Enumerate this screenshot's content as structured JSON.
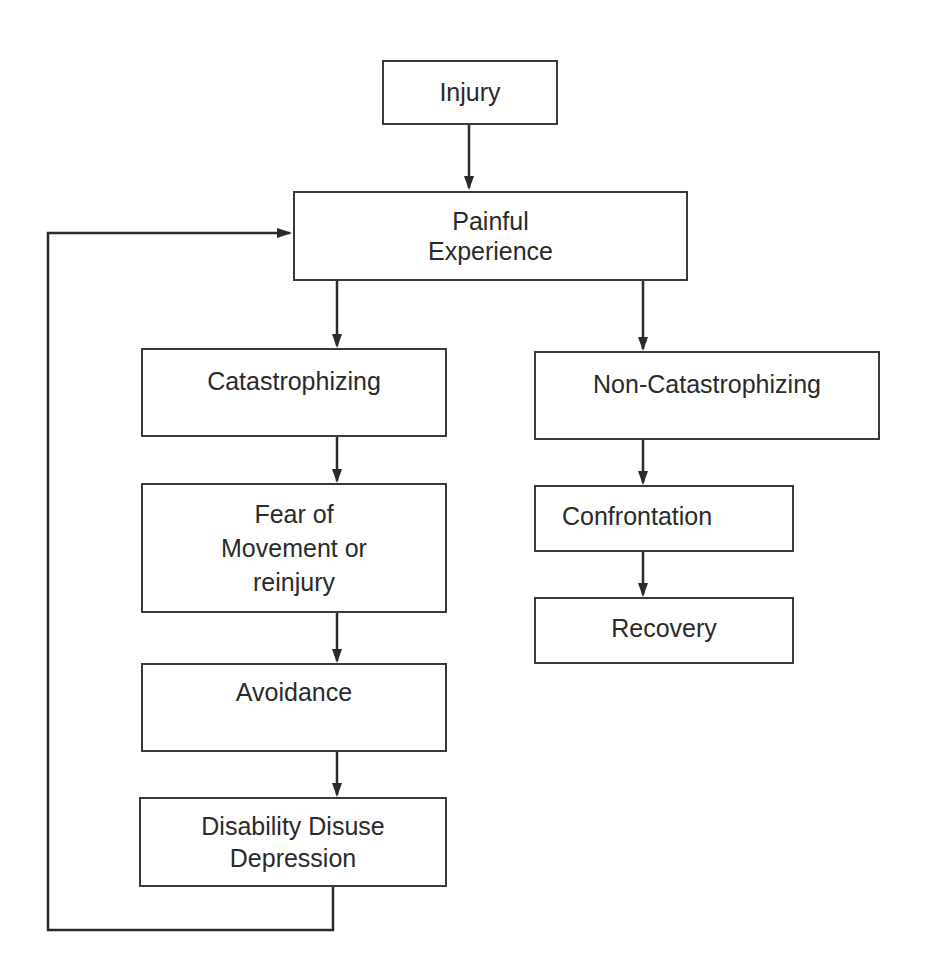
{
  "diagram": {
    "type": "flowchart",
    "nodes": {
      "injury": {
        "label": "Injury"
      },
      "painful": {
        "line1": "Painful",
        "line2": "Experience"
      },
      "catastrophizing": {
        "label": "Catastrophizing"
      },
      "fear": {
        "line1": "Fear of",
        "line2": "Movement or",
        "line3": "reinjury"
      },
      "avoidance": {
        "label": "Avoidance"
      },
      "disability": {
        "line1": "Disability Disuse",
        "line2": "Depression"
      },
      "non_catastrophizing": {
        "label": "Non-Catastrophizing"
      },
      "confrontation": {
        "label": "Confrontation"
      },
      "recovery": {
        "label": "Recovery"
      }
    },
    "edges": [
      {
        "from": "Injury",
        "to": "Painful Experience"
      },
      {
        "from": "Painful Experience",
        "to": "Catastrophizing"
      },
      {
        "from": "Painful Experience",
        "to": "Non-Catastrophizing"
      },
      {
        "from": "Catastrophizing",
        "to": "Fear of Movement or reinjury"
      },
      {
        "from": "Fear of Movement or reinjury",
        "to": "Avoidance"
      },
      {
        "from": "Avoidance",
        "to": "Disability Disuse Depression"
      },
      {
        "from": "Disability Disuse Depression",
        "to": "Painful Experience"
      },
      {
        "from": "Non-Catastrophizing",
        "to": "Confrontation"
      },
      {
        "from": "Confrontation",
        "to": "Recovery"
      }
    ],
    "colors": {
      "line": "#2a2a2a",
      "text": "#2a2a2a",
      "background": "#ffffff"
    }
  }
}
